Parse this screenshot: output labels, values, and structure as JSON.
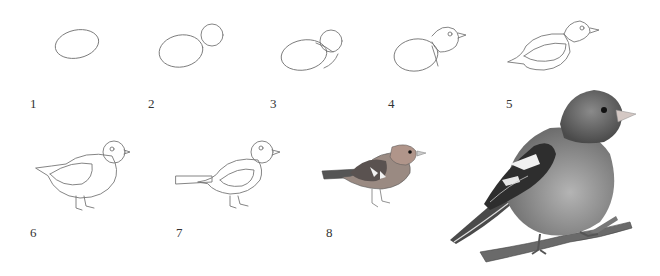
{
  "steps": [
    {
      "number": "1",
      "description": "Body oval"
    },
    {
      "number": "2",
      "description": "Add head circle"
    },
    {
      "number": "3",
      "description": "Connect head and body"
    },
    {
      "number": "4",
      "description": "Add eye and beak"
    },
    {
      "number": "5",
      "description": "Add wing and tail outline"
    },
    {
      "number": "6",
      "description": "Add legs"
    },
    {
      "number": "7",
      "description": "Extend tail"
    },
    {
      "number": "8",
      "description": "Shade and color"
    }
  ],
  "final_illustration": "Finished chaffinch perched on branch",
  "colors": {
    "background": "#ffffff",
    "sketch_line": "#777777",
    "label_text": "#333333",
    "bird_body": "#8c8c8c",
    "bird_dark": "#3a3a3a",
    "wing_white": "#f2f2f2"
  }
}
